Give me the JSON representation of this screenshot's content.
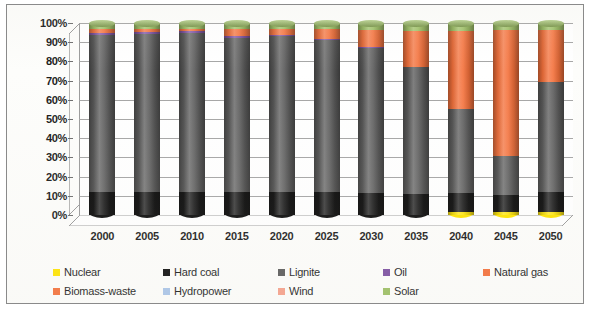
{
  "chart_data": {
    "type": "bar",
    "subtype": "stacked-100-percent-cylinder-3d",
    "title": "",
    "xlabel": "",
    "ylabel": "",
    "ylim": [
      0,
      100
    ],
    "ytick_labels": [
      "100%",
      "90%",
      "80%",
      "70%",
      "60%",
      "50%",
      "40%",
      "30%",
      "20%",
      "10%",
      "0%"
    ],
    "ytick_values": [
      100,
      90,
      80,
      70,
      60,
      50,
      40,
      30,
      20,
      10,
      0
    ],
    "grid": true,
    "legend_position": "bottom",
    "categories": [
      "2000",
      "2005",
      "2010",
      "2015",
      "2020",
      "2025",
      "2030",
      "2035",
      "2040",
      "2045",
      "2050"
    ],
    "series": [
      {
        "name": "Nuclear",
        "color": "#FFE400",
        "values": [
          0,
          0,
          0,
          0,
          0,
          0,
          0,
          0,
          1,
          1.5,
          1
        ]
      },
      {
        "name": "Hard coal",
        "color": "#0D0D0D",
        "values": [
          12,
          12,
          12,
          12,
          12,
          12,
          11.5,
          11,
          10.5,
          9,
          11
        ]
      },
      {
        "name": "Lignite",
        "color": "#5A5A5A",
        "values": [
          82,
          82.5,
          83,
          80,
          81,
          79,
          75.5,
          66,
          43.5,
          20,
          57.5
        ]
      },
      {
        "name": "Oil",
        "color": "#7B4FA0",
        "values": [
          1,
          1,
          1,
          1,
          1,
          0.5,
          0.5,
          0,
          0,
          0,
          0
        ]
      },
      {
        "name": "Natural gas",
        "color": "#F4703A",
        "values": [
          2,
          1.5,
          1,
          4,
          3,
          5.5,
          9,
          19,
          41,
          66,
          27
        ]
      },
      {
        "name": "Biomass-waste",
        "color": "#F4703A",
        "values": [
          0,
          0,
          0,
          0,
          0,
          0,
          0,
          0,
          0,
          0,
          0
        ]
      },
      {
        "name": "Hydropower",
        "color": "#A9C4E8",
        "values": [
          0,
          0,
          0,
          0,
          0,
          0,
          0,
          0,
          0,
          0,
          0
        ]
      },
      {
        "name": "Wind",
        "color": "#F6A08A",
        "values": [
          0,
          0,
          0,
          0,
          0,
          0,
          0,
          0,
          0,
          0,
          0
        ]
      },
      {
        "name": "Solar",
        "color": "#9BBE62",
        "values": [
          3,
          3,
          3,
          3,
          3,
          3,
          3.5,
          4,
          4,
          3.5,
          3.5
        ]
      }
    ]
  },
  "legend": {
    "row1": [
      {
        "label": "Nuclear",
        "color": "#FFE400"
      },
      {
        "label": "Hard coal",
        "color": "#0D0D0D"
      },
      {
        "label": "Lignite",
        "color": "#5A5A5A"
      },
      {
        "label": "Oil",
        "color": "#7B4FA0"
      },
      {
        "label": "Natural gas",
        "color": "#F4703A"
      }
    ],
    "row2": [
      {
        "label": "Biomass-waste",
        "color": "#F4703A"
      },
      {
        "label": "Hydropower",
        "color": "#A9C4E8"
      },
      {
        "label": "Wind",
        "color": "#F6A08A"
      },
      {
        "label": "Solar",
        "color": "#9BBE62"
      }
    ]
  },
  "colors": {
    "gridline": "#a6a6a6",
    "axis": "#6e6e6e",
    "frame": "#8a8a8a",
    "plot_background": "#ffffff"
  }
}
